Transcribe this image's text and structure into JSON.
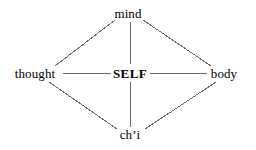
{
  "diagram": {
    "title": "",
    "background_color": "#ffffff",
    "line_color": "#6b6b6b",
    "text_color": "#000000",
    "nodes": [
      {
        "id": "mind",
        "label": "mind",
        "x": 128,
        "y": 13,
        "emphasis": false
      },
      {
        "id": "thought",
        "label": "thought",
        "x": 35,
        "y": 73,
        "emphasis": false
      },
      {
        "id": "self",
        "label": "SELF",
        "x": 130,
        "y": 73,
        "emphasis": true
      },
      {
        "id": "body",
        "label": "body",
        "x": 224,
        "y": 73,
        "emphasis": false
      },
      {
        "id": "chi",
        "label": "ch’i",
        "x": 130,
        "y": 134,
        "emphasis": false
      }
    ],
    "edges": [
      {
        "id": "mind-thought",
        "from": "mind",
        "to": "thought",
        "x1": 115,
        "y1": 20,
        "x2": 55,
        "y2": 66
      },
      {
        "id": "mind-body",
        "from": "mind",
        "to": "body",
        "x1": 143,
        "y1": 20,
        "x2": 211,
        "y2": 66
      },
      {
        "id": "mind-self",
        "from": "mind",
        "to": "self",
        "x1": 130,
        "y1": 22,
        "x2": 130,
        "y2": 64
      },
      {
        "id": "thought-self",
        "from": "thought",
        "to": "self",
        "x1": 63,
        "y1": 73,
        "x2": 112,
        "y2": 73
      },
      {
        "id": "self-body",
        "from": "self",
        "to": "body",
        "x1": 150,
        "y1": 73,
        "x2": 207,
        "y2": 73
      },
      {
        "id": "self-chi",
        "from": "self",
        "to": "chi",
        "x1": 130,
        "y1": 82,
        "x2": 130,
        "y2": 127
      },
      {
        "id": "thought-chi",
        "from": "thought",
        "to": "chi",
        "x1": 49,
        "y1": 82,
        "x2": 117,
        "y2": 129
      },
      {
        "id": "body-chi",
        "from": "body",
        "to": "chi",
        "x1": 216,
        "y1": 82,
        "x2": 145,
        "y2": 129
      }
    ]
  }
}
